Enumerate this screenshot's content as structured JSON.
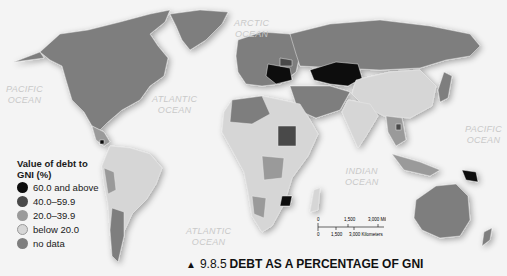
{
  "oceans": [
    {
      "id": "arctic",
      "label": "ARCTIC OCEAN",
      "lines": [
        "ARCTIC",
        "OCEAN"
      ],
      "x": 234,
      "y": 18
    },
    {
      "id": "pacific-west",
      "label": "PACIFIC OCEAN",
      "lines": [
        "PACIFIC",
        "OCEAN"
      ],
      "x": 6,
      "y": 84
    },
    {
      "id": "atlantic-north",
      "label": "ATLANTIC OCEAN",
      "lines": [
        "ATLANTIC",
        "OCEAN"
      ],
      "x": 152,
      "y": 94
    },
    {
      "id": "indian",
      "label": "INDIAN OCEAN",
      "lines": [
        "INDIAN",
        "OCEAN"
      ],
      "x": 345,
      "y": 166
    },
    {
      "id": "pacific-east",
      "label": "PACIFIC OCEAN",
      "lines": [
        "PACIFIC",
        "OCEAN"
      ],
      "x": 465,
      "y": 124
    },
    {
      "id": "atlantic-south",
      "label": "ATLANTIC OCEAN",
      "lines": [
        "ATLANTIC",
        "OCEAN"
      ],
      "x": 186,
      "y": 226
    }
  ],
  "legend": {
    "title": "Value of debt to GNI (%)",
    "items": [
      {
        "label": "60.0 and above",
        "color": "#0d0d0d"
      },
      {
        "label": "40.0–59.9",
        "color": "#4a4a4a"
      },
      {
        "label": "20.0–39.9",
        "color": "#9a9a9a"
      },
      {
        "label": "below 20.0",
        "color": "#d6d6d6"
      },
      {
        "label": "no data",
        "color": "#7e7e7e"
      }
    ]
  },
  "scale_bar": {
    "miles": [
      "0",
      "1,500",
      "3,000 Miles"
    ],
    "kilometers": [
      "0",
      "1,500",
      "3,000 Kilometers"
    ]
  },
  "caption": {
    "marker": "▲",
    "number": "9.8.5",
    "title": "DEBT AS A PERCENTAGE OF GNI"
  },
  "colors": {
    "land_nodata": "#7e7e7e",
    "land_low": "#d6d6d6",
    "land_20_39": "#9a9a9a",
    "land_40_59": "#4a4a4a",
    "land_60plus": "#0d0d0d",
    "ocean": "#f4f4f4"
  }
}
